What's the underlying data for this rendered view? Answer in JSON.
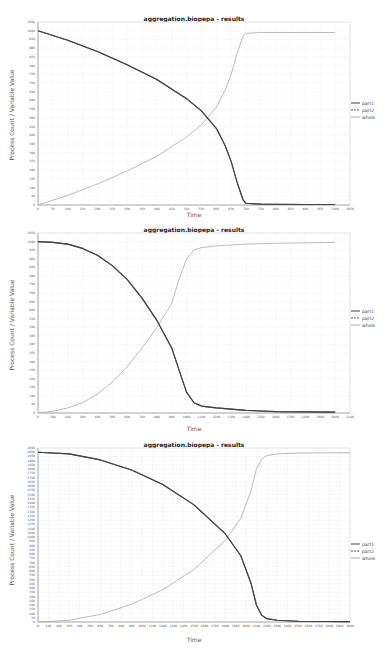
{
  "chart_data": [
    {
      "type": "line",
      "title": "aggregation.biopepa - results",
      "xlabel": "Time",
      "ylabel": "Process Count / Variable Value",
      "xlim": [
        0,
        1050
      ],
      "ylim": [
        0,
        1050
      ],
      "xticks": [
        0,
        50,
        100,
        150,
        200,
        250,
        300,
        350,
        400,
        450,
        500,
        550,
        600,
        650,
        700,
        750,
        800,
        850,
        900,
        950,
        1000,
        1050
      ],
      "yticks": [
        0,
        50,
        100,
        150,
        200,
        250,
        300,
        350,
        400,
        450,
        500,
        550,
        600,
        650,
        700,
        750,
        800,
        850,
        900,
        950,
        1000,
        1050
      ],
      "grid": true,
      "legend_position": "right",
      "x": [
        0,
        100,
        200,
        300,
        400,
        500,
        550,
        600,
        630,
        650,
        670,
        690,
        700,
        750,
        800,
        900,
        1000
      ],
      "series": [
        {
          "name": "part1",
          "color": "#444444",
          "values": [
            1000,
            945,
            880,
            805,
            720,
            610,
            540,
            440,
            340,
            250,
            130,
            30,
            10,
            5,
            4,
            3,
            3
          ]
        },
        {
          "name": "part2",
          "color": "#555555",
          "values": [
            1000,
            945,
            880,
            805,
            720,
            610,
            540,
            440,
            340,
            250,
            130,
            30,
            10,
            5,
            4,
            3,
            3
          ]
        },
        {
          "name": "whole",
          "color": "#aaaaaa",
          "values": [
            0,
            55,
            120,
            195,
            280,
            390,
            460,
            560,
            660,
            750,
            870,
            970,
            985,
            990,
            990,
            990,
            990
          ]
        }
      ]
    },
    {
      "type": "line",
      "title": "aggregation.biopepa - results",
      "xlabel": "Time",
      "ylabel": "Process Count / Variable Value",
      "xlim": [
        0,
        2100
      ],
      "ylim": [
        0,
        1050
      ],
      "xticks": [
        0,
        100,
        200,
        300,
        400,
        500,
        600,
        700,
        800,
        900,
        1000,
        1100,
        1200,
        1300,
        1400,
        1500,
        1600,
        1700,
        1800,
        1900,
        2000,
        2100
      ],
      "yticks": [
        0,
        50,
        100,
        150,
        200,
        250,
        300,
        350,
        400,
        450,
        500,
        550,
        600,
        650,
        700,
        750,
        800,
        850,
        900,
        950,
        1000,
        1050
      ],
      "grid": true,
      "legend_position": "right",
      "x": [
        0,
        100,
        200,
        300,
        400,
        500,
        600,
        700,
        800,
        900,
        950,
        1000,
        1050,
        1100,
        1200,
        1400,
        1600,
        2000
      ],
      "series": [
        {
          "name": "part1",
          "color": "#444444",
          "values": [
            1000,
            995,
            985,
            960,
            920,
            860,
            780,
            670,
            540,
            380,
            250,
            120,
            60,
            40,
            30,
            15,
            8,
            5
          ]
        },
        {
          "name": "part2",
          "color": "#555555",
          "values": [
            1000,
            995,
            985,
            960,
            920,
            860,
            780,
            670,
            540,
            380,
            250,
            120,
            60,
            40,
            30,
            15,
            8,
            5
          ]
        },
        {
          "name": "whole",
          "color": "#aaaaaa",
          "values": [
            0,
            10,
            30,
            60,
            110,
            180,
            270,
            380,
            500,
            640,
            780,
            900,
            950,
            965,
            975,
            985,
            990,
            995
          ]
        }
      ]
    },
    {
      "type": "line",
      "title": "aggregation.biopepa - results",
      "xlabel": "Time",
      "ylabel": "Process Count / Variable Value",
      "xlim": [
        0,
        3000
      ],
      "ylim": [
        0,
        2050
      ],
      "xticks": [
        0,
        100,
        200,
        300,
        400,
        500,
        600,
        700,
        800,
        900,
        1000,
        1100,
        1200,
        1300,
        1400,
        1500,
        1600,
        1700,
        1800,
        1900,
        2000,
        2100,
        2200,
        2300,
        2400,
        2500,
        2600,
        2700,
        2800,
        2900,
        3000
      ],
      "yticks_step": 50,
      "grid": true,
      "legend_position": "right",
      "x": [
        0,
        300,
        600,
        900,
        1200,
        1500,
        1800,
        1950,
        2050,
        2100,
        2150,
        2200,
        2300,
        2500,
        3000
      ],
      "series": [
        {
          "name": "part1",
          "color": "#444444",
          "values": [
            2000,
            1980,
            1910,
            1790,
            1620,
            1380,
            1040,
            780,
            450,
            200,
            80,
            40,
            20,
            10,
            5
          ]
        },
        {
          "name": "part2",
          "color": "#555555",
          "values": [
            2000,
            1980,
            1910,
            1790,
            1620,
            1380,
            1040,
            780,
            450,
            200,
            80,
            40,
            20,
            10,
            5
          ]
        },
        {
          "name": "whole",
          "color": "#aaaaaa",
          "values": [
            0,
            20,
            90,
            210,
            380,
            620,
            960,
            1220,
            1550,
            1800,
            1920,
            1960,
            1980,
            1990,
            1995
          ]
        }
      ]
    }
  ],
  "charts": [
    {
      "title": "aggregation.biopepa - results",
      "xlabel": "Time",
      "ylabel": "Process Count / Variable Value",
      "legend": [
        "part1",
        "part2",
        "whole"
      ]
    },
    {
      "title": "aggregation.biopepa - results",
      "xlabel": "Time",
      "ylabel": "Process Count / Variable Value",
      "legend": [
        "part1",
        "part2",
        "whole"
      ]
    },
    {
      "title": "aggregation.biopepa - results",
      "xlabel": "Time",
      "ylabel": "Process Count / Variable Value",
      "legend": [
        "part1",
        "part2",
        "whole"
      ]
    }
  ]
}
